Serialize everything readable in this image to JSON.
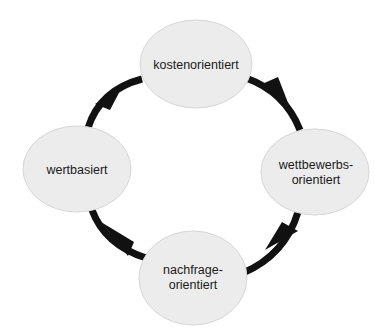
{
  "diagram": {
    "type": "cycle",
    "title": "",
    "colors": {
      "background": "#ffffff",
      "node_fill": "#ececec",
      "node_stroke": "#d6d6d6",
      "arrow": "#111111",
      "text": "#1a1a1a"
    },
    "nodes": [
      {
        "id": "kosten",
        "label": "kostenorientiert",
        "cx": 196,
        "cy": 64,
        "rx": 56,
        "ry": 44
      },
      {
        "id": "wettbewerb",
        "label": "wettbewerbs-\norientiert",
        "cx": 315,
        "cy": 172,
        "rx": 54,
        "ry": 43
      },
      {
        "id": "nachfrage",
        "label": "nachfrage-\norientiert",
        "cx": 193,
        "cy": 278,
        "rx": 54,
        "ry": 47
      },
      {
        "id": "wert",
        "label": "wertbasiert",
        "cx": 77,
        "cy": 169,
        "rx": 54,
        "ry": 43
      }
    ],
    "edges": [
      {
        "from": "kosten",
        "to": "wettbewerb",
        "direction": "clockwise"
      },
      {
        "from": "wettbewerb",
        "to": "nachfrage",
        "direction": "clockwise"
      },
      {
        "from": "nachfrage",
        "to": "wert",
        "direction": "clockwise"
      },
      {
        "from": "wert",
        "to": "kosten",
        "direction": "clockwise"
      }
    ]
  }
}
